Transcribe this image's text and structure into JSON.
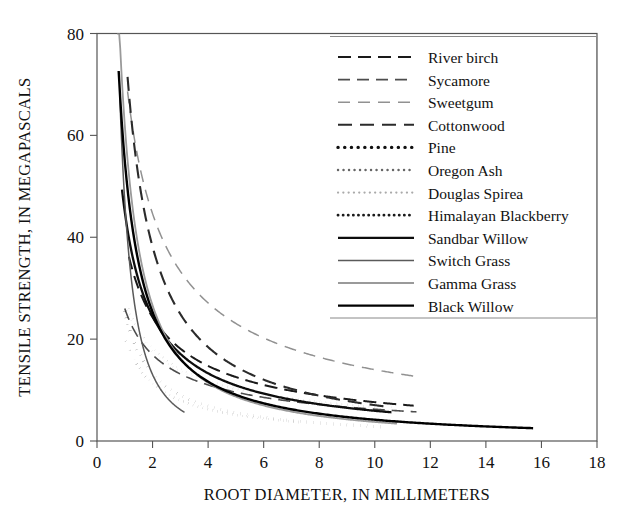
{
  "chart_data": {
    "type": "line",
    "title": "",
    "xlabel": "ROOT DIAMETER, IN MILLIMETERS",
    "ylabel": "TENSILE STRENGTH, IN MEGAPASCALS",
    "xlim": [
      0,
      18
    ],
    "ylim": [
      0,
      80
    ],
    "xticks": [
      0,
      2,
      4,
      6,
      8,
      10,
      12,
      14,
      16,
      18
    ],
    "yticks": [
      0,
      20,
      40,
      60,
      80
    ],
    "grid": false,
    "legend_position": "upper-right-inside",
    "note": "Power-law decay curves: tensile strength = a * d^(-b) over each species' measured root-diameter range",
    "series": [
      {
        "name": "River birch",
        "style": "dashed",
        "color": "#1a1a1a",
        "width": 2.0,
        "dash": "13,7",
        "a": 40.0,
        "b": 0.72,
        "x_start": 1.15,
        "x_end": 11.4,
        "points": [
          {
            "x": 1.15,
            "y": 36.4
          },
          {
            "x": 1.5,
            "y": 30.1
          },
          {
            "x": 2.0,
            "y": 24.4
          },
          {
            "x": 2.5,
            "y": 20.9
          },
          {
            "x": 3.0,
            "y": 18.3
          },
          {
            "x": 4.0,
            "y": 14.8
          },
          {
            "x": 5.0,
            "y": 12.6
          },
          {
            "x": 6.0,
            "y": 11.1
          },
          {
            "x": 7.0,
            "y": 9.9
          },
          {
            "x": 8.0,
            "y": 9.0
          },
          {
            "x": 9.0,
            "y": 8.3
          },
          {
            "x": 10.0,
            "y": 7.7
          },
          {
            "x": 11.4,
            "y": 7.0
          }
        ]
      },
      {
        "name": "Sycamore",
        "style": "dashed",
        "color": "#4d4d4d",
        "width": 1.6,
        "dash": "12,7",
        "a": 26.0,
        "b": 0.62,
        "x_start": 1.0,
        "x_end": 11.5,
        "points": [
          {
            "x": 1.0,
            "y": 26.0
          },
          {
            "x": 1.5,
            "y": 20.3
          },
          {
            "x": 2.0,
            "y": 16.9
          },
          {
            "x": 2.5,
            "y": 14.7
          },
          {
            "x": 3.0,
            "y": 13.2
          },
          {
            "x": 4.0,
            "y": 11.0
          },
          {
            "x": 5.0,
            "y": 9.6
          },
          {
            "x": 6.0,
            "y": 8.6
          },
          {
            "x": 7.0,
            "y": 7.8
          },
          {
            "x": 8.0,
            "y": 7.2
          },
          {
            "x": 9.0,
            "y": 6.8
          },
          {
            "x": 10.0,
            "y": 6.4
          },
          {
            "x": 11.5,
            "y": 5.9
          }
        ]
      },
      {
        "name": "Sweetgum",
        "style": "dashed",
        "color": "#919191",
        "width": 1.5,
        "dash": "12,8",
        "a": 73.5,
        "b": 0.72,
        "x_start": 1.1,
        "x_end": 11.4,
        "points": [
          {
            "x": 1.1,
            "y": 68.8
          },
          {
            "x": 1.5,
            "y": 55.3
          },
          {
            "x": 2.0,
            "y": 44.7
          },
          {
            "x": 2.5,
            "y": 38.3
          },
          {
            "x": 3.0,
            "y": 33.6
          },
          {
            "x": 4.0,
            "y": 27.2
          },
          {
            "x": 5.0,
            "y": 23.1
          },
          {
            "x": 6.0,
            "y": 20.3
          },
          {
            "x": 7.0,
            "y": 18.2
          },
          {
            "x": 8.0,
            "y": 16.6
          },
          {
            "x": 9.0,
            "y": 15.3
          },
          {
            "x": 10.0,
            "y": 14.2
          },
          {
            "x": 11.4,
            "y": 12.9
          }
        ]
      },
      {
        "name": "Cottonwood",
        "style": "dashed",
        "color": "#2b2b2b",
        "width": 2.1,
        "dash": "14,8",
        "a": 79.0,
        "b": 1.05,
        "x_start": 1.1,
        "x_end": 10.6,
        "points": [
          {
            "x": 1.1,
            "y": 71.0
          },
          {
            "x": 1.5,
            "y": 51.3
          },
          {
            "x": 2.0,
            "y": 38.1
          },
          {
            "x": 2.5,
            "y": 30.2
          },
          {
            "x": 3.0,
            "y": 25.0
          },
          {
            "x": 4.0,
            "y": 18.4
          },
          {
            "x": 5.0,
            "y": 14.5
          },
          {
            "x": 6.0,
            "y": 11.9
          },
          {
            "x": 7.0,
            "y": 10.1
          },
          {
            "x": 8.0,
            "y": 8.8
          },
          {
            "x": 9.0,
            "y": 7.7
          },
          {
            "x": 10.6,
            "y": 6.5
          }
        ]
      },
      {
        "name": "Pine",
        "style": "dotted",
        "color": "#111111",
        "width": 3.4,
        "dash": "0.1,6.6",
        "a": 25.5,
        "b": 0.95,
        "x_start": 0.95,
        "x_end": 10.4,
        "points": [
          {
            "x": 0.95,
            "y": 26.7
          },
          {
            "x": 1.3,
            "y": 19.9
          },
          {
            "x": 1.8,
            "y": 14.6
          },
          {
            "x": 2.3,
            "y": 11.6
          },
          {
            "x": 3.0,
            "y": 9.0
          },
          {
            "x": 4.0,
            "y": 6.9
          },
          {
            "x": 5.0,
            "y": 5.6
          },
          {
            "x": 6.0,
            "y": 4.7
          },
          {
            "x": 7.0,
            "y": 4.1
          },
          {
            "x": 8.0,
            "y": 3.6
          },
          {
            "x": 9.0,
            "y": 3.2
          },
          {
            "x": 10.4,
            "y": 2.8
          }
        ]
      },
      {
        "name": "Oregon Ash",
        "style": "dotted",
        "color": "#666666",
        "width": 2.4,
        "dash": "0.1,5.4",
        "a": 28.0,
        "b": 0.62,
        "x_start": 1.0,
        "x_end": 10.1,
        "points": [
          {
            "x": 1.0,
            "y": 28.0
          },
          {
            "x": 1.5,
            "y": 21.9
          },
          {
            "x": 2.0,
            "y": 18.2
          },
          {
            "x": 2.5,
            "y": 15.9
          },
          {
            "x": 3.0,
            "y": 14.2
          },
          {
            "x": 4.0,
            "y": 11.8
          },
          {
            "x": 5.0,
            "y": 10.3
          },
          {
            "x": 6.0,
            "y": 9.2
          },
          {
            "x": 7.0,
            "y": 8.4
          },
          {
            "x": 8.0,
            "y": 7.8
          },
          {
            "x": 9.0,
            "y": 7.2
          },
          {
            "x": 10.1,
            "y": 6.8
          }
        ]
      },
      {
        "name": "Douglas Spirea",
        "style": "dotted",
        "color": "#aaaaaa",
        "width": 2.2,
        "dash": "0.1,5.2",
        "a": 26.5,
        "b": 0.6,
        "x_start": 1.0,
        "x_end": 10.0,
        "points": [
          {
            "x": 1.0,
            "y": 26.5
          },
          {
            "x": 1.5,
            "y": 21.0
          },
          {
            "x": 2.0,
            "y": 17.5
          },
          {
            "x": 2.5,
            "y": 15.4
          },
          {
            "x": 3.0,
            "y": 13.9
          },
          {
            "x": 4.0,
            "y": 11.6
          },
          {
            "x": 5.0,
            "y": 10.2
          },
          {
            "x": 6.0,
            "y": 9.2
          },
          {
            "x": 7.0,
            "y": 8.4
          },
          {
            "x": 8.0,
            "y": 7.8
          },
          {
            "x": 9.0,
            "y": 7.3
          },
          {
            "x": 10.0,
            "y": 6.9
          }
        ]
      },
      {
        "name": "Himalayan Blackberry",
        "style": "dotted",
        "color": "#1a1a1a",
        "width": 2.8,
        "dash": "0.1,5.0",
        "a": 20.5,
        "b": 0.86,
        "x_start": 1.05,
        "x_end": 7.4,
        "points": [
          {
            "x": 1.05,
            "y": 19.7
          },
          {
            "x": 1.5,
            "y": 14.5
          },
          {
            "x": 2.0,
            "y": 11.3
          },
          {
            "x": 2.5,
            "y": 9.4
          },
          {
            "x": 3.0,
            "y": 8.0
          },
          {
            "x": 4.0,
            "y": 6.3
          },
          {
            "x": 5.0,
            "y": 5.2
          },
          {
            "x": 6.0,
            "y": 4.5
          },
          {
            "x": 7.4,
            "y": 3.7
          }
        ]
      },
      {
        "name": "Sandbar Willow",
        "style": "solid",
        "color": "#0d0d0d",
        "width": 2.3,
        "dash": "",
        "a": 45.0,
        "b": 0.88,
        "x_start": 0.9,
        "x_end": 10.6,
        "points": [
          {
            "x": 0.9,
            "y": 49.3
          },
          {
            "x": 1.2,
            "y": 38.3
          },
          {
            "x": 1.6,
            "y": 29.8
          },
          {
            "x": 2.0,
            "y": 24.5
          },
          {
            "x": 2.6,
            "y": 19.6
          },
          {
            "x": 3.2,
            "y": 16.4
          },
          {
            "x": 4.0,
            "y": 13.5
          },
          {
            "x": 5.0,
            "y": 11.1
          },
          {
            "x": 6.0,
            "y": 9.5
          },
          {
            "x": 7.0,
            "y": 8.3
          },
          {
            "x": 8.0,
            "y": 7.4
          },
          {
            "x": 9.0,
            "y": 6.7
          },
          {
            "x": 10.6,
            "y": 5.8
          }
        ]
      },
      {
        "name": "Switch Grass",
        "style": "solid",
        "color": "#5a5a5a",
        "width": 1.5,
        "dash": "",
        "a": 47.0,
        "b": 1.85,
        "x_start": 0.82,
        "x_end": 3.15,
        "points": [
          {
            "x": 0.82,
            "y": 67.5
          },
          {
            "x": 0.9,
            "y": 56.5
          },
          {
            "x": 1.0,
            "y": 47.0
          },
          {
            "x": 1.2,
            "y": 34.0
          },
          {
            "x": 1.4,
            "y": 25.6
          },
          {
            "x": 1.7,
            "y": 17.9
          },
          {
            "x": 2.0,
            "y": 13.3
          },
          {
            "x": 2.4,
            "y": 9.5
          },
          {
            "x": 2.8,
            "y": 7.2
          },
          {
            "x": 3.15,
            "y": 5.8
          }
        ]
      },
      {
        "name": "Gamma Grass",
        "style": "solid",
        "color": "#9a9a9a",
        "width": 1.8,
        "dash": "",
        "a": 62.0,
        "b": 1.22,
        "x_start": 0.72,
        "x_end": 10.8,
        "points": [
          {
            "x": 0.72,
            "y": 77.8
          },
          {
            "x": 0.85,
            "y": 63.5
          },
          {
            "x": 1.0,
            "y": 52.4
          },
          {
            "x": 1.3,
            "y": 37.5
          },
          {
            "x": 1.7,
            "y": 26.5
          },
          {
            "x": 2.2,
            "y": 19.2
          },
          {
            "x": 3.0,
            "y": 13.1
          },
          {
            "x": 4.0,
            "y": 9.3
          },
          {
            "x": 5.0,
            "y": 7.1
          },
          {
            "x": 6.5,
            "y": 5.2
          },
          {
            "x": 8.0,
            "y": 4.0
          },
          {
            "x": 10.8,
            "y": 2.9
          }
        ]
      },
      {
        "name": "Black Willow",
        "style": "solid",
        "color": "#000000",
        "width": 2.4,
        "dash": "",
        "a": 55.0,
        "b": 1.12,
        "x_start": 0.78,
        "x_end": 15.7,
        "points": [
          {
            "x": 0.78,
            "y": 76.5
          },
          {
            "x": 0.95,
            "y": 59.0
          },
          {
            "x": 1.2,
            "y": 44.8
          },
          {
            "x": 1.6,
            "y": 32.0
          },
          {
            "x": 2.0,
            "y": 24.9
          },
          {
            "x": 2.6,
            "y": 18.5
          },
          {
            "x": 3.4,
            "y": 13.6
          },
          {
            "x": 4.5,
            "y": 9.9
          },
          {
            "x": 6.0,
            "y": 7.1
          },
          {
            "x": 8.0,
            "y": 5.1
          },
          {
            "x": 10.0,
            "y": 3.9
          },
          {
            "x": 12.5,
            "y": 3.0
          },
          {
            "x": 15.7,
            "y": 2.4
          }
        ]
      }
    ]
  },
  "axes": {
    "y_ticks": [
      "0",
      "20",
      "40",
      "60",
      "80"
    ],
    "x_ticks": [
      "0",
      "2",
      "4",
      "6",
      "8",
      "10",
      "12",
      "14",
      "16",
      "18"
    ],
    "x_title": "ROOT DIAMETER, IN MILLIMETERS",
    "y_title": "TENSILE STRENGTH, IN MEGAPASCALS"
  },
  "legend": {
    "entries": [
      {
        "label": "River birch"
      },
      {
        "label": "Sycamore"
      },
      {
        "label": "Sweetgum"
      },
      {
        "label": "Cottonwood"
      },
      {
        "label": "Pine"
      },
      {
        "label": "Oregon Ash"
      },
      {
        "label": "Douglas Spirea"
      },
      {
        "label": "Himalayan Blackberry"
      },
      {
        "label": "Sandbar Willow"
      },
      {
        "label": "Switch Grass"
      },
      {
        "label": "Gamma Grass"
      },
      {
        "label": "Black Willow"
      }
    ]
  }
}
